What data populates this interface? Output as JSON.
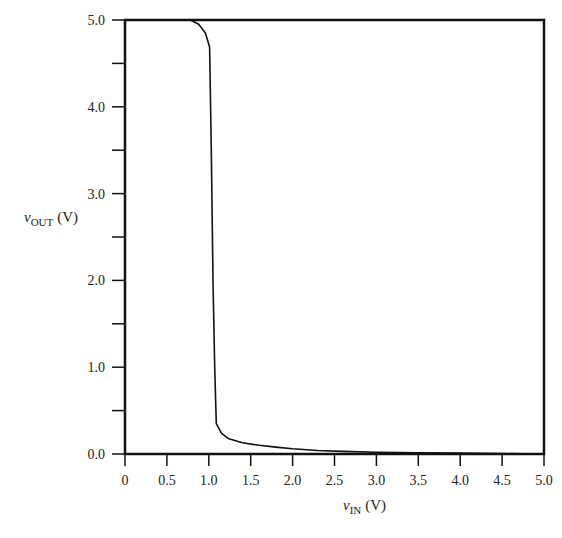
{
  "chart_data": {
    "type": "line",
    "title": "",
    "xlabel": "v_IN (V)",
    "ylabel": "v_OUT (V)",
    "xlabel_parts": {
      "var": "v",
      "sub": "IN",
      "unit": "(V)"
    },
    "ylabel_parts": {
      "var": "v",
      "sub": "OUT",
      "unit": "(V)"
    },
    "xlim": [
      0,
      5.0
    ],
    "ylim": [
      0,
      5.0
    ],
    "x_ticks": [
      "0",
      "0.5",
      "1.0",
      "1.5",
      "2.0",
      "2.5",
      "3.0",
      "3.5",
      "4.0",
      "4.5",
      "5.0"
    ],
    "y_ticks": [
      "0.0",
      "1.0",
      "2.0",
      "3.0",
      "4.0",
      "5.0"
    ],
    "y_minor_ticks": [
      0.5,
      1.5,
      2.5,
      3.5,
      4.5
    ],
    "grid": false,
    "legend": null,
    "series": [
      {
        "name": "v_OUT",
        "color": "#111111",
        "x": [
          0.0,
          0.5,
          0.78,
          0.88,
          0.96,
          1.01,
          1.03,
          1.05,
          1.07,
          1.09,
          1.15,
          1.23,
          1.4,
          1.6,
          1.8,
          2.0,
          2.3,
          2.6,
          3.0,
          3.5,
          4.0,
          4.5,
          5.0
        ],
        "values": [
          5.0,
          5.0,
          5.0,
          4.95,
          4.85,
          4.69,
          3.5,
          2.0,
          1.0,
          0.35,
          0.24,
          0.18,
          0.13,
          0.1,
          0.08,
          0.06,
          0.04,
          0.03,
          0.02,
          0.015,
          0.01,
          0.005,
          0.0
        ]
      }
    ]
  }
}
